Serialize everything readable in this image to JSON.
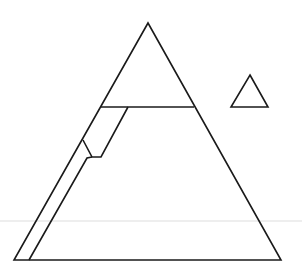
{
  "diagram": {
    "width": 302,
    "height": 274,
    "stroke_color": "#1a1a1a",
    "guide_color": "#dedede",
    "stroke_width": 1.6,
    "shapes": {
      "guide_line": {
        "x1": 0,
        "y1": 221,
        "x2": 302,
        "y2": 221
      },
      "large_triangle": {
        "points": "148,23 281,260 14,260"
      },
      "cut_line": {
        "x1": 100,
        "y1": 107,
        "x2": 194,
        "y2": 107
      },
      "inner_strip": {
        "points": "128,107 101,157 92,157 83,140"
      },
      "inner_strip_lower": {
        "points": "92,157 87,158 29,260"
      },
      "small_triangle": {
        "points": "250,75 268,107 231,107"
      }
    }
  }
}
